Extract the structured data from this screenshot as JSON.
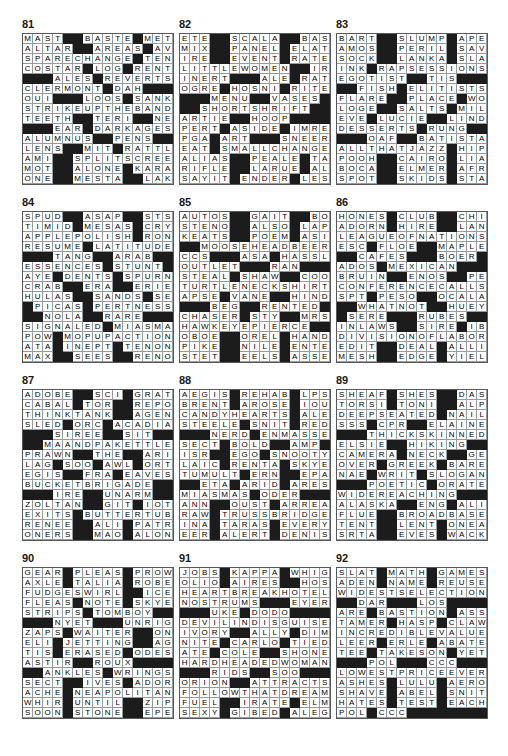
{
  "page": {
    "kind": "crossword-answer-key",
    "grid_size": 15,
    "block_char": "#",
    "columns": 3,
    "rows": 4
  },
  "puzzles": [
    {
      "number": "81",
      "rows": [
        "MAST##BASTE#MET",
        "ALTAR##AREAS#AVE",
        "SPARECHANGE#TEN",
        "COSTAR#LOG#RENT",
        "###ALES#REVERTS",
        "CLERMONT#DAH###",
        "OUI###LOOS#SANKA",
        "STRIKEUPTHEBAND",
        "TEETH##TERI##NEO",
        "###EAR#DARKAGES",
        "ALUMNUS##PENS##",
        "LENS##MIT#RATTLE",
        "AMI##SPLITSCREEN",
        "MOT##ALONE#KARAN",
        "ONE##MESTA##LAKE"
      ]
    },
    {
      "number": "82",
      "rows": [
        "ETE##SCALA##BASIS",
        "MIX##PANEL#ELATE",
        "IRE##EVENT#RATED",
        "LITTLEWOMEN##IRA",
        "INERT###ALE#RAT",
        "OGRE#HOSNI#RITE",
        "###MENU##VASES",
        "##SHORTSHRIFT##",
        "ARTIE##HOOP###",
        "PERT#ASIDE#IMRE",
        "PGA#ART###SNEER",
        "EAT#SMALLCHANGE",
        "ALIAS##PEALE#TAC",
        "RIFLE##LARUE#ALT",
        "SAYIT#ENDER#LES"
      ]
    },
    {
      "number": "83",
      "rows": [
        "BART##SLUMP#APES",
        "AMOS##PERIL#SAVE",
        "SOCK##LANKA#SLAW",
        "INK#RAPSESSIONS",
        "EGOTIST##TIS###",
        "##FISH#ELITISTS",
        "FLARE##PLACE#WOW",
        "LOGE##SALTS#MILA",
        "EVE#LUCIE##LINDY",
        "DESSERTS#RUNG##",
        "###OAF##BATISTA",
        "ALLTHATJAZZ#HIP",
        "POOH##CAIRO#LIAR",
        "BOCA##ELMER#AFRO",
        "SPOT##SKIDS#STAN"
      ]
    },
    {
      "number": "84",
      "rows": [
        "SPUD##ASAP##STS",
        "TIMID#MESAS#CRY",
        "APPLEPOLISH#RON",
        "RESUME#LATITUDE",
        "###TANG##ARAB##",
        "ESSENCES#STUNT",
        "AYE#DENTS#SPURN",
        "CRAB##ERA##ERIE",
        "HULAS##SANDS#SEW",
        "#PICAS#PERTNESS",
        "##NOLA##RARE###",
        "SIGNALED#MIASMA",
        "POW#MOPUPACTION",
        "ATA#INEPT#TENON",
        "MAX##SEES##RENO"
      ]
    },
    {
      "number": "85",
      "rows": [
        "AUTOS##GAIT##BOSS",
        "STENO##ALSO#LAPP",
        "KEATS##POEM#ASIA",
        "##MOOSEHEADBEER",
        "CCS###ASA#HASSLE",
        "OUTLET###RAN###",
        "STEAL#SHAW##COOS",
        "TURTLENECKSHIRT",
        "APSE#VANE##HINDU",
        "###BEG##RENTED",
        "CHASER#STY##MRS",
        "HAWKEYEPIERCE##",
        "OBOE##OREL#HANDS",
        "PIKE##NILE#ENTER",
        "STET##EELS#ASSES"
      ]
    },
    {
      "number": "86",
      "rows": [
        "HONES#CLUB##CHIP",
        "ADORN#HIRE##LANA",
        "LEAGUEOFNATIONS",
        "ESC#FLOE##MAPLES",
        "##CAFES###BOER#",
        "ADOS#MEXICAN###",
        "BRUIN##ENOS##PEI",
        "CONFERENCECALLS",
        "SPT#PESO##OCALA",
        "##WHATNOT##HUEY",
        "#SERE###RUBES##",
        "INLAWS##SIRE#IBM",
        "DIVISIONOFLABOR",
        "EDIT##DEAL#ALLIE",
        "MESH##EDGE#YIELD"
      ]
    },
    {
      "number": "87",
      "rows": [
        "ADOBE##SCI#GRATE",
        "CABAL#TOR##REPOT",
        "THINKTANK##AGENT",
        "SLED#ORC#ACADIA",
        "###SIREE##SIT##",
        "##MAANDPAKETTLE",
        "PRAWN##THE##ARIA",
        "LAG#SOO#AWL#ORT",
        "EGIS##FRA#EAVES",
        "BUCKETBRIGADE##",
        "###IRE##UNARM##",
        "ZOLTAN##GIT#IOTA",
        "EXITS#BUTTERTUB",
        "RENEE##ALI#PATRI",
        "ONERS##MAO#ALONE"
      ]
    },
    {
      "number": "88",
      "rows": [
        "AEGIS#REHAB#LPS",
        "BRENT#AROSE#IOU",
        "CANDYHEARTS#ALE",
        "STEELE#SNIT#RED",
        "###NERD#ENMASSE",
        "SECT#BOLD##AMP#",
        "ISR##EGO#SNOOTY",
        "LAIC#RENTA#SKYE",
        "TUMULT#ERN##EPA",
        "##ETA#ARID#ARES",
        "MIASMAS#ODER###",
        "ANN##OUST#ARREAR",
        "RAW#TRUSSBRIDGE",
        "INA#TARAS#EVERY",
        "EER#ALERT#DENIS"
      ]
    },
    {
      "number": "89",
      "rows": [
        "SHEAF#SHES##DASH",
        "TORSI#TONI##ALPO",
        "DEEPSEATED#NAIL",
        "SSS#CPR##ELAINE",
        "###THICKSKINNED",
        "ELSIE##HIKING##",
        "CAMERA#NECK##GEM",
        "OVER#GREEK#BARE",
        "NAE#WRIT#SLOGAN",
        "###POETIC#ORATE",
        "WIDEREACHING###",
        "ALASKA##ENG#ALI",
        "FLUE##BROADBASED",
        "TENT##LENT#ONEAL",
        "SRTA##EVES#WACKY"
      ]
    },
    {
      "number": "90",
      "rows": [
        "GEAR#PLEAS#PROWL",
        "AXLE#TALIA#ROBE",
        "FUDGESWIRL##ICER",
        "FLEAS#NOTE#SKYE",
        "STRIPS#TOMBOY##",
        "###NYET###UNRIG",
        "ZAPS#WAITER##ONE",
        "ELI#JETTING##AGO",
        "TIS#ERASED#ODES",
        "ASTIR##ROUX###",
        "##ANKLES#WRINGS",
        "SECT##IVES#ADORE",
        "ACHE#NEAPOLITAN",
        "WHIR#UNTIL##ZIPS",
        "SOON#STONE##EPEE"
      ]
    },
    {
      "number": "91",
      "rows": [
        "JOBS#KAPPA#WHIG",
        "OLIO#AIRES##HOSE",
        "HEARTBREAKHOTEL",
        "NOSTRUMS###EYERS",
        "###UKE#DODO###",
        "DEVILINDISGUISE",
        "IVORY##ALLY#DIM",
        "NITE#CARLO#TIED",
        "ATE#COLE##SHONE",
        "HARDHEADEDWOMAN",
        "###RIDS##SOO###",
        "ORION##ATTRACTS",
        "FOLLOWTHATDREAM",
        "FUEL##IRATE#ELMO",
        "SEXY#GIBED#ALEG"
      ]
    },
    {
      "number": "92",
      "rows": [
        "SLAT#MATH#GAMES",
        "ADEN#NAME#REUSE",
        "WIDESTSELECTION",
        "##DAR###LOS###",
        "ARE#BASTION#ASS",
        "TAMER#HASP#CLAW",
        "INCREDIBLEVALUE",
        "LEER#ERLE#ABATE",
        "TEE#TAKESON#YET",
        "###POL###CCC##",
        "LOWESTPRICEEVER",
        "ASHES#LULU#AERO",
        "SHAVE#ABEL#SNIT",
        "HATES#TEST#EACH",
        "POL#CCC#####"
      ]
    }
  ]
}
